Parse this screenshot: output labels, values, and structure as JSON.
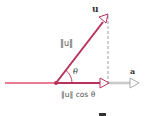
{
  "diagram": {
    "labels": {
      "u": "u",
      "norm_u": "‖u‖",
      "theta": "θ",
      "a": "a",
      "projection": "‖u‖ cos θ"
    },
    "colors": {
      "vector_u": "#b8325a",
      "baseline": "#e0506e",
      "projection": "#b8325a",
      "vector_a": "#aaaaaa",
      "dashed": "#888888",
      "arrowhead_fill": "#ffffff"
    },
    "geometry": {
      "origin": [
        56,
        83
      ],
      "u_tip": [
        108,
        15
      ],
      "projection_tip": [
        108,
        83
      ],
      "a_tip": [
        138,
        83
      ],
      "baseline_start": [
        5,
        83
      ]
    }
  }
}
